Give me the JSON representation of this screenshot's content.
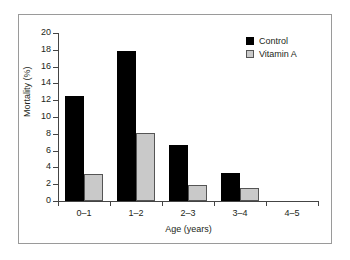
{
  "chart_data": {
    "type": "bar",
    "title": "",
    "subtitle": "",
    "xlabel": "Age (years)",
    "ylabel": "Mortality (%)",
    "categories": [
      "0–1",
      "1–2",
      "2–3",
      "3–4",
      "4–5"
    ],
    "series": [
      {
        "name": "Control",
        "color": "#000000",
        "values": [
          12.5,
          17.9,
          6.7,
          3.3,
          0
        ]
      },
      {
        "name": "Vitamin A",
        "color": "#c9c9c9",
        "values": [
          3.2,
          8.1,
          1.9,
          1.6,
          0
        ]
      }
    ],
    "ylim": [
      0,
      20
    ],
    "yticks": [
      0,
      2,
      4,
      6,
      8,
      10,
      12,
      14,
      16,
      18,
      20
    ],
    "ytick_labels": [
      "0",
      "2",
      "4",
      "6",
      "8",
      "10",
      "12",
      "14",
      "16",
      "18",
      "20"
    ],
    "grid": false,
    "legend_position": "top-right",
    "frame": "outer-box"
  },
  "legend": {
    "items": [
      {
        "label": "Control",
        "swatch": "black-square-icon"
      },
      {
        "label": "Vitamin A",
        "swatch": "gray-square-icon"
      }
    ]
  }
}
